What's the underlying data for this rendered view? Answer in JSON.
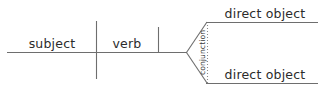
{
  "diagram": {
    "type": "reed-kellogg-sentence-diagram",
    "background_color": "#ffffff",
    "line_color": "#6e6e6e",
    "dotted_line_color": "#8a8a8a",
    "text_color": "#2b2b2b",
    "labels": {
      "subject": "subject",
      "verb": "verb",
      "conjunction": "conjunction",
      "direct_object_top": "direct object",
      "direct_object_bottom": "direct object"
    }
  }
}
